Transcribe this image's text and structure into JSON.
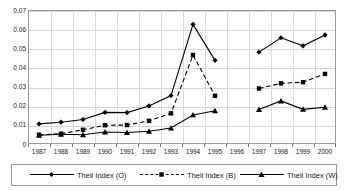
{
  "chart_data": {
    "type": "line",
    "title": "",
    "subtitle": "",
    "xlabel": "",
    "ylabel": "",
    "categories": [
      "1987",
      "1988",
      "1989",
      "1990",
      "1991",
      "1992",
      "1993",
      "1994",
      "1995",
      "1996",
      "1997",
      "1998",
      "1999",
      "2000"
    ],
    "ylim": [
      0,
      0.07
    ],
    "yticks": [
      0,
      0.01,
      0.02,
      0.03,
      0.04,
      0.05,
      0.06,
      0.07
    ],
    "ytick_labels": [
      "0",
      "0.01",
      "0.02",
      "0.03",
      "0.04",
      "0.05",
      "0.06",
      "0.07"
    ],
    "grid": true,
    "legend_position": "bottom",
    "series": [
      {
        "name": "Theil Index (O)",
        "marker": "diamond",
        "linestyle": "solid",
        "color": "#000000",
        "values": [
          0.0105,
          0.0114,
          0.0128,
          0.0165,
          0.0164,
          0.0199,
          0.0253,
          0.0625,
          0.0437,
          null,
          0.048,
          0.0555,
          0.0513,
          0.057
        ]
      },
      {
        "name": "Theil Index (B)",
        "marker": "square",
        "linestyle": "dashed",
        "color": "#000000",
        "values": [
          0.0048,
          0.0054,
          0.0074,
          0.0098,
          0.0099,
          0.0121,
          0.016,
          0.0465,
          0.0252,
          null,
          0.029,
          0.0317,
          0.0323,
          0.0366
        ]
      },
      {
        "name": "Theil Index (W)",
        "marker": "triangle",
        "linestyle": "solid",
        "color": "#000000",
        "values": [
          0.0046,
          0.0051,
          0.0048,
          0.0063,
          0.006,
          0.0067,
          0.0084,
          0.0152,
          0.0174,
          null,
          0.018,
          0.0225,
          0.0181,
          0.0192
        ]
      }
    ]
  },
  "legend": {
    "items": [
      {
        "label": "Theil Index (O)",
        "marker": "diamond-marker-icon",
        "linestyle": "solid"
      },
      {
        "label": "Theil Index (B)",
        "marker": "square-marker-icon",
        "linestyle": "dashed"
      },
      {
        "label": "Theil Index (W)",
        "marker": "triangle-marker-icon",
        "linestyle": "solid"
      }
    ]
  },
  "colors": {
    "plot_border": "#9a9a9a",
    "gridline": "#d3d3d3",
    "series_line": "#000000",
    "background": "#ffffff",
    "text": "#222222"
  }
}
